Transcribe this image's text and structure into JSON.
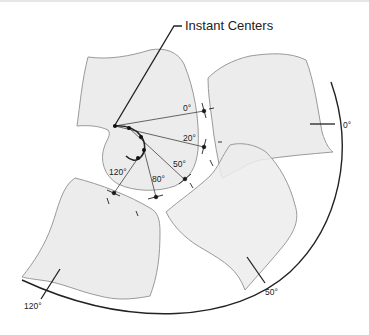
{
  "diagram": {
    "title": "Instant Centers",
    "colors": {
      "bone_fill": "#ececec",
      "bone_stroke": "#9a9a9a",
      "line": "#222222",
      "ray": "#555555"
    },
    "angle_labels_inner": [
      "0°",
      "20°",
      "50°",
      "80°",
      "120°"
    ],
    "position_labels_outer": {
      "p0": "0°",
      "p50": "50°",
      "p120": "120°"
    }
  }
}
